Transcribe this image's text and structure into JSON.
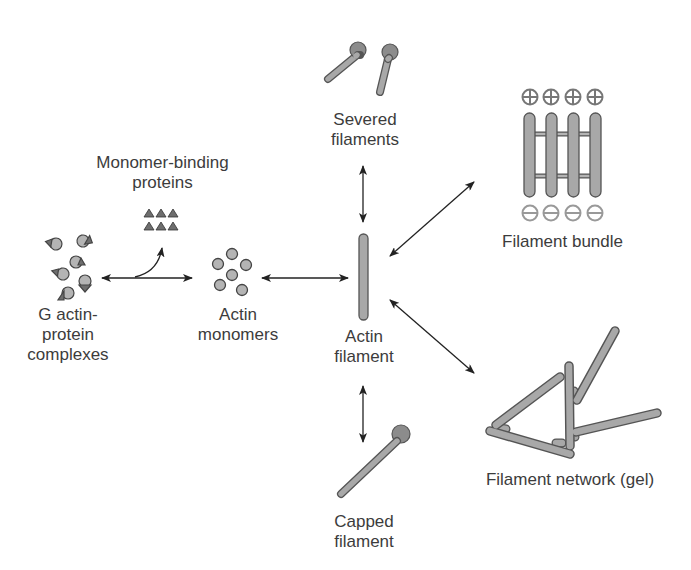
{
  "diagram": {
    "colors": {
      "filament_fill": "#a8a8a8",
      "filament_stroke": "#555555",
      "cap_fill": "#8c8c8c",
      "monomer_fill": "#b4b4b4",
      "protein_fill": "#6e6e6e",
      "arrow": "#222222",
      "text": "#3c3c3c",
      "polarity_mark": "#777777"
    },
    "nodes": {
      "monomer_binding": {
        "line1": "Monomer-binding",
        "line2": "proteins"
      },
      "g_actin_complexes": {
        "line1": "G actin-",
        "line2": "protein",
        "line3": "complexes"
      },
      "actin_monomers": {
        "line1": "Actin",
        "line2": "monomers"
      },
      "actin_filament": {
        "line1": "Actin",
        "line2": "filament"
      },
      "severed_filaments": {
        "line1": "Severed",
        "line2": "filaments"
      },
      "capped_filament": {
        "line1": "Capped",
        "line2": "filament"
      },
      "filament_bundle": {
        "line1": "Filament bundle",
        "plus_ends": [
          "+",
          "+",
          "+",
          "+"
        ],
        "minus_ends": [
          "−",
          "−",
          "−",
          "−"
        ]
      },
      "filament_network": {
        "line1": "Filament network (gel)"
      }
    },
    "arrows": [
      {
        "from": "g_actin_complexes",
        "to": "actin_monomers",
        "type": "bidirectional"
      },
      {
        "from": "g_actin_complexes/actin_monomers",
        "to": "monomer_binding",
        "type": "branch"
      },
      {
        "from": "actin_monomers",
        "to": "actin_filament",
        "type": "bidirectional"
      },
      {
        "from": "actin_filament",
        "to": "severed_filaments",
        "type": "bidirectional"
      },
      {
        "from": "actin_filament",
        "to": "capped_filament",
        "type": "bidirectional"
      },
      {
        "from": "actin_filament",
        "to": "filament_bundle",
        "type": "bidirectional"
      },
      {
        "from": "actin_filament",
        "to": "filament_network",
        "type": "bidirectional"
      }
    ]
  }
}
